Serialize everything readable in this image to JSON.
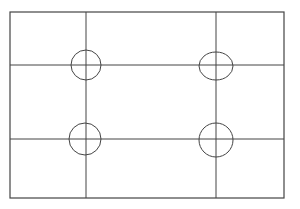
{
  "diagram": {
    "type": "grid-with-intersection-markers",
    "canvas": {
      "width": 300,
      "height": 209,
      "background": "#ffffff"
    },
    "stroke_color": "#444444",
    "frame": {
      "x1": 10,
      "y1": 12,
      "x2": 284,
      "y2": 198
    },
    "vertical_lines": [
      86,
      216
    ],
    "horizontal_lines": [
      65,
      139
    ],
    "markers": [
      {
        "name": "top-left",
        "cx": 86,
        "cy": 65,
        "rx": 15,
        "ry": 15
      },
      {
        "name": "top-right",
        "cx": 216,
        "cy": 66,
        "rx": 17,
        "ry": 14
      },
      {
        "name": "bottom-left",
        "cx": 85,
        "cy": 139,
        "rx": 16,
        "ry": 16
      },
      {
        "name": "bottom-right",
        "cx": 216,
        "cy": 140,
        "rx": 17,
        "ry": 17
      }
    ]
  }
}
